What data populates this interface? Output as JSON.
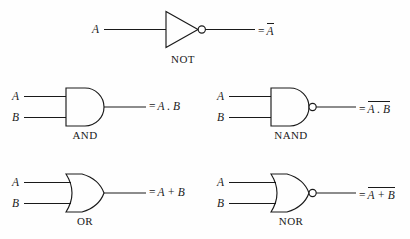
{
  "diagram": {
    "background_color": "#fefefe",
    "line_color": "#1a1a1a",
    "gates": [
      {
        "id": "not",
        "name": "NOT",
        "inputs": [
          "A"
        ],
        "output_prefix": "=",
        "output_expression": "A",
        "output_overbar": true,
        "has_bubble": true,
        "shape": "triangle"
      },
      {
        "id": "and",
        "name": "AND",
        "inputs": [
          "A",
          "B"
        ],
        "output_prefix": "=",
        "output_expression": "A . B",
        "output_overbar": false,
        "has_bubble": false,
        "shape": "d-shape"
      },
      {
        "id": "nand",
        "name": "NAND",
        "inputs": [
          "A",
          "B"
        ],
        "output_prefix": "=",
        "output_expression": "A . B",
        "output_overbar": true,
        "has_bubble": true,
        "shape": "d-shape"
      },
      {
        "id": "or",
        "name": "OR",
        "inputs": [
          "A",
          "B"
        ],
        "output_prefix": "=",
        "output_expression": "A + B",
        "output_overbar": false,
        "has_bubble": false,
        "shape": "curved-shield"
      },
      {
        "id": "nor",
        "name": "NOR",
        "inputs": [
          "A",
          "B"
        ],
        "output_prefix": "=",
        "output_expression": "A + B",
        "output_overbar": true,
        "has_bubble": true,
        "shape": "curved-shield"
      }
    ],
    "operand_a": "A",
    "operand_b": "B",
    "equals_sign": "=",
    "and_operator": ".",
    "or_operator": "+"
  }
}
